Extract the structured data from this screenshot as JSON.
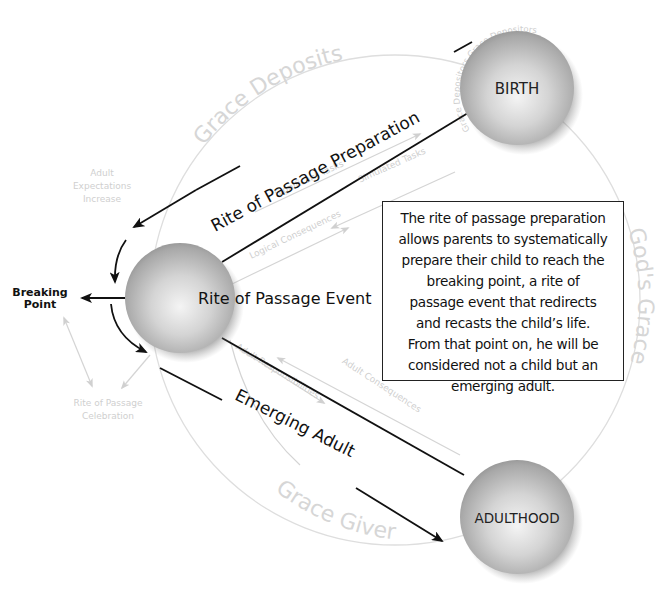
{
  "nodes": {
    "birth": {
      "label": "BIRTH"
    },
    "event": {
      "label": "Rite of Passage Event"
    },
    "adulthood": {
      "label": "ADULTHOOD"
    },
    "breaking_point": {
      "line1": "Breaking",
      "line2": "Point"
    }
  },
  "paths": {
    "preparation": "Rite of Passage Preparation",
    "emerging": "Emerging Adult"
  },
  "circle_labels": {
    "top": "Grace Deposits",
    "right": "God's Grace",
    "bottom": "Grace Giver",
    "birth_ring": "Grace Depositors Grace Depositors"
  },
  "faint_labels": {
    "adult_expectations": [
      "Adult",
      "Expectations",
      "Increase"
    ],
    "significant_tasks": "Significant Tasks",
    "simulated_tasks": "Simulated Tasks",
    "logical_consequences": "Logical Consequences",
    "adult_responsibilities": "Adult Responsibilities",
    "adult_consequences": "Adult Consequences",
    "celebration": [
      "Rite of Passage",
      "Celebration"
    ]
  },
  "description": {
    "lines": [
      "The rite of passage preparation",
      "allows parents to systematically",
      "prepare their child to reach the",
      "breaking point, a rite of",
      "passage event that redirects",
      "and recasts the child’s life.",
      "From that point on, he will be",
      "considered not a child but an",
      "emerging adult."
    ]
  },
  "colors": {
    "ink": "#111111",
    "faint": "#cfcfcf",
    "sphere_light": "#f2f2f2",
    "sphere_dark": "#8a8a8a"
  }
}
